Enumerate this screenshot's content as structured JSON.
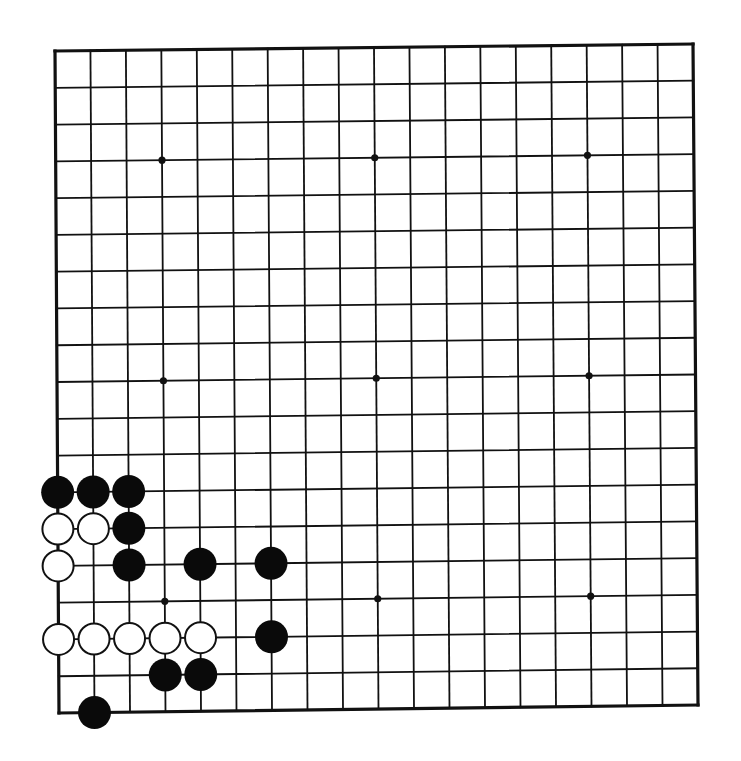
{
  "board": {
    "size": 19,
    "corners": {
      "top_left": [
        55,
        51
      ],
      "top_right": [
        693,
        44
      ],
      "bottom_left": [
        59,
        713
      ],
      "bottom_right": [
        698,
        705
      ]
    },
    "line_color": "#111111",
    "background": "#ffffff",
    "star_points": [
      [
        3,
        3
      ],
      [
        3,
        9
      ],
      [
        3,
        15
      ],
      [
        9,
        3
      ],
      [
        9,
        9
      ],
      [
        9,
        15
      ],
      [
        15,
        3
      ],
      [
        15,
        9
      ],
      [
        15,
        15
      ]
    ],
    "stones": [
      {
        "color": "black",
        "row": 12,
        "col": 0
      },
      {
        "color": "black",
        "row": 12,
        "col": 1
      },
      {
        "color": "black",
        "row": 12,
        "col": 2
      },
      {
        "color": "white",
        "row": 13,
        "col": 0
      },
      {
        "color": "white",
        "row": 13,
        "col": 1
      },
      {
        "color": "black",
        "row": 13,
        "col": 2
      },
      {
        "color": "white",
        "row": 14,
        "col": 0
      },
      {
        "color": "black",
        "row": 14,
        "col": 2
      },
      {
        "color": "black",
        "row": 14,
        "col": 4
      },
      {
        "color": "black",
        "row": 14,
        "col": 6
      },
      {
        "color": "white",
        "row": 16,
        "col": 0
      },
      {
        "color": "white",
        "row": 16,
        "col": 1
      },
      {
        "color": "white",
        "row": 16,
        "col": 2
      },
      {
        "color": "white",
        "row": 16,
        "col": 3
      },
      {
        "color": "white",
        "row": 16,
        "col": 4
      },
      {
        "color": "black",
        "row": 16,
        "col": 6
      },
      {
        "color": "black",
        "row": 17,
        "col": 3
      },
      {
        "color": "black",
        "row": 17,
        "col": 4
      },
      {
        "color": "black",
        "row": 18,
        "col": 1
      }
    ]
  }
}
